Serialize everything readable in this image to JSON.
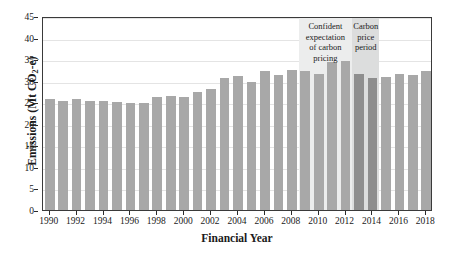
{
  "chart_data": {
    "type": "bar",
    "title": "",
    "xlabel": "Financial Year",
    "ylabel": "Emissions (Mt CO2-e)",
    "ylabel_parts": {
      "pre": "Emissions (Mt CO",
      "sub": "2",
      "post": "-e)"
    },
    "ylim": [
      0,
      45
    ],
    "ytick_step": 5,
    "yticks": [
      0,
      5,
      10,
      15,
      20,
      25,
      30,
      35,
      40,
      45
    ],
    "grid": true,
    "legend_position": "none",
    "xtick_labels": [
      "1990",
      "1992",
      "1994",
      "1996",
      "1998",
      "2000",
      "2002",
      "2004",
      "2006",
      "2008",
      "2010",
      "2012",
      "2014",
      "2016",
      "2018"
    ],
    "categories": [
      "1990",
      "1991",
      "1992",
      "1993",
      "1994",
      "1995",
      "1996",
      "1997",
      "1998",
      "1999",
      "2000",
      "2001",
      "2002",
      "2003",
      "2004",
      "2005",
      "2006",
      "2007",
      "2008",
      "2009",
      "2010",
      "2011",
      "2012",
      "2013",
      "2014",
      "2015",
      "2016",
      "2017",
      "2018"
    ],
    "values": [
      25.8,
      25.2,
      25.7,
      25.4,
      25.3,
      25.0,
      24.8,
      24.9,
      26.1,
      26.4,
      26.3,
      27.3,
      28.1,
      30.7,
      31.0,
      29.8,
      32.2,
      31.3,
      32.4,
      32.3,
      31.5,
      34.4,
      34.6,
      31.6,
      30.6,
      30.9,
      31.6,
      31.3,
      32.3
    ],
    "bar_color": "#a8a8a8",
    "bar_color_highlight": "#8e8e8e",
    "annotations": [
      {
        "name": "confident-expectation-band",
        "label": "Confident expectation of carbon pricing",
        "label_lines": [
          "Confident",
          "expectation",
          "of carbon",
          "pricing"
        ],
        "start_year": "2009",
        "end_year": "2013",
        "color": "#eceded"
      },
      {
        "name": "carbon-price-period-band",
        "label": "Carbon price period",
        "label_lines": [
          "Carbon",
          "price",
          "period"
        ],
        "start_year": "2013",
        "end_year": "2015",
        "color": "#dcdddd"
      }
    ]
  }
}
